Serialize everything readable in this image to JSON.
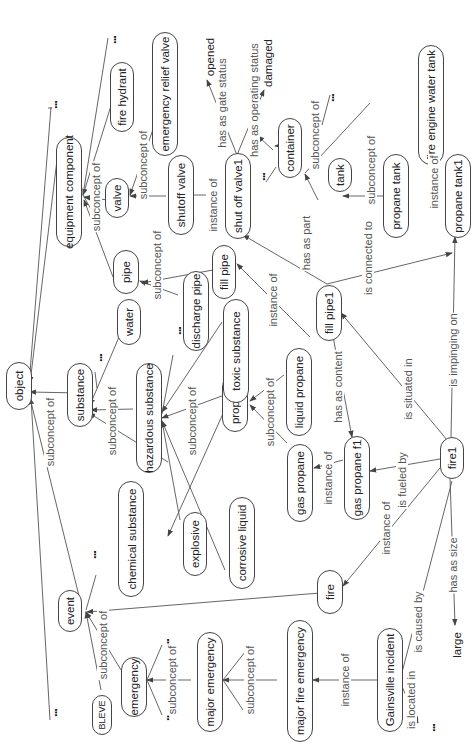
{
  "diagram": {
    "type": "ontology concept map (rotated 90° counter-clockwise)",
    "nodes": {
      "object": "object",
      "substance": "substance",
      "equipment_component": "equipment component",
      "event": "event",
      "bleve": "BLEVE",
      "emergency": "emergency",
      "major_emergency": "major emergency",
      "major_fire_emergency": "major fire emergency",
      "gainsville_incident": "Gainsville incident",
      "fire": "fire",
      "fire1": "fire1",
      "chemical_substance": "chemical substance",
      "explosive": "explosive",
      "corrosive_liquid": "corrosive liquid",
      "hazardous_substance": "hazardous substance",
      "water": "water",
      "propane": "propane",
      "toxic_substance": "toxic substance",
      "gas_propane": "gas propane",
      "liquid_propane": "liquid propane",
      "gas_propane_f1": "gas propane f1",
      "fill_pipe1": "fill pipe1",
      "pipe": "pipe",
      "discharge_pipe": "discharge pipe",
      "fill_pipe": "fill pipe",
      "valve": "valve",
      "fire_hydrant": "fire hydrant",
      "emergency_relief_valve": "emergency relief valve",
      "shutoff_valve": "shutoff valve",
      "shut_off_valve1": "shut off valve1",
      "container": "container",
      "tank": "tank",
      "propane_tank": "propane tank",
      "fire_engine_water_tank": "fire engine water tank",
      "propane_tank1": "propane tank1"
    },
    "values": {
      "opened": "opened",
      "damaged": "damaged",
      "large": "large",
      "ellipsis": "..."
    },
    "edge_labels": {
      "subconcept_of": "subconcept of",
      "instance_of": "instance of",
      "has_as_gate_status": "has as gate status",
      "has_as_operating_status": "has as operating status",
      "has_as_part": "has as part",
      "is_connected_to": "is connected to",
      "has_as_content": "has as content",
      "is_situated_in": "is situated in",
      "is_impinging_on": "is impinging on",
      "is_fueled_by": "is fueled by",
      "has_as_size": "has as size",
      "is_caused_by": "is caused by",
      "is_located_in": "is located in"
    },
    "edges": [
      {
        "from": "substance",
        "to": "object",
        "label": "subconcept of"
      },
      {
        "from": "equipment component",
        "to": "object",
        "label": "subconcept of"
      },
      {
        "from": "event",
        "to": "object",
        "label": "subconcept of"
      },
      {
        "from": "valve",
        "to": "equipment component",
        "label": "subconcept of"
      },
      {
        "from": "fire hydrant",
        "to": "equipment component",
        "label": "subconcept of"
      },
      {
        "from": "pipe",
        "to": "equipment component",
        "label": "subconcept of"
      },
      {
        "from": "emergency relief valve",
        "to": "valve",
        "label": "subconcept of"
      },
      {
        "from": "shutoff valve",
        "to": "valve",
        "label": "subconcept of"
      },
      {
        "from": "shut off valve1",
        "to": "shutoff valve",
        "label": "instance of"
      },
      {
        "from": "shut off valve1",
        "to": "opened",
        "label": "has as gate status"
      },
      {
        "from": "shut off valve1",
        "to": "damaged",
        "label": "has as operating status"
      },
      {
        "from": "tank",
        "to": "container",
        "label": "subconcept of"
      },
      {
        "from": "propane tank",
        "to": "tank",
        "label": "subconcept of"
      },
      {
        "from": "fire engine water tank",
        "to": "tank",
        "label": "subconcept of"
      },
      {
        "from": "propane tank1",
        "to": "propane tank",
        "label": "instance of"
      },
      {
        "from": "discharge pipe",
        "to": "pipe",
        "label": "subconcept of"
      },
      {
        "from": "fill pipe",
        "to": "pipe",
        "label": "subconcept of"
      },
      {
        "from": "fill pipe1",
        "to": "fill pipe",
        "label": "instance of"
      },
      {
        "from": "fill pipe1",
        "to": "shut off valve1",
        "label": "has as part"
      },
      {
        "from": "fill pipe1",
        "to": "propane tank1",
        "label": "is connected to"
      },
      {
        "from": "fill pipe1",
        "to": "gas propane f1",
        "label": "has as content"
      },
      {
        "from": "water",
        "to": "substance",
        "label": "subconcept of"
      },
      {
        "from": "hazardous substance",
        "to": "substance",
        "label": "subconcept of"
      },
      {
        "from": "chemical substance",
        "to": "substance",
        "label": "subconcept of"
      },
      {
        "from": "toxic substance",
        "to": "hazardous substance",
        "label": "subconcept of"
      },
      {
        "from": "propane",
        "to": "hazardous substance",
        "label": "subconcept of"
      },
      {
        "from": "explosive",
        "to": "hazardous substance",
        "label": "subconcept of"
      },
      {
        "from": "corrosive liquid",
        "to": "hazardous substance",
        "label": "subconcept of"
      },
      {
        "from": "propane",
        "to": "chemical substance",
        "label": "subconcept of"
      },
      {
        "from": "liquid propane",
        "to": "propane",
        "label": "subconcept of"
      },
      {
        "from": "gas propane",
        "to": "propane",
        "label": "subconcept of"
      },
      {
        "from": "gas propane f1",
        "to": "gas propane",
        "label": "instance of"
      },
      {
        "from": "fire1",
        "to": "fill pipe1",
        "label": "is situated in"
      },
      {
        "from": "fire1",
        "to": "propane tank1",
        "label": "is impinging on"
      },
      {
        "from": "fire1",
        "to": "gas propane f1",
        "label": "is fueled by"
      },
      {
        "from": "fire1",
        "to": "fire",
        "label": "instance of"
      },
      {
        "from": "fire1",
        "to": "large",
        "label": "has as size"
      },
      {
        "from": "fire",
        "to": "event",
        "label": "subconcept of"
      },
      {
        "from": "BLEVE",
        "to": "event",
        "label": "subconcept of"
      },
      {
        "from": "emergency",
        "to": "event",
        "label": "subconcept of"
      },
      {
        "from": "major emergency",
        "to": "emergency",
        "label": "subconcept of"
      },
      {
        "from": "major fire emergency",
        "to": "major emergency",
        "label": "subconcept of"
      },
      {
        "from": "Gainsville incident",
        "to": "major fire emergency",
        "label": "instance of"
      },
      {
        "from": "Gainsville incident",
        "to": "fire1",
        "label": "is caused by"
      },
      {
        "from": "Gainsville incident",
        "to": "...",
        "label": "is located in"
      }
    ]
  }
}
